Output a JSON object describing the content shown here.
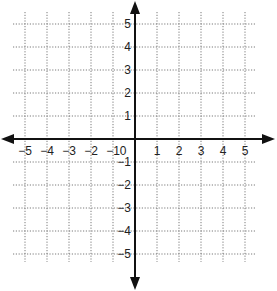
{
  "diagram": {
    "type": "coordinate-plane",
    "x_range": [
      -5,
      5
    ],
    "y_range": [
      -5,
      5
    ],
    "grid": "dotted",
    "origin_label": "0",
    "x_tick_labels": [
      "−5",
      "−4",
      "−3",
      "−2",
      "−1",
      "1",
      "2",
      "3",
      "4",
      "5"
    ],
    "y_tick_labels": [
      "5",
      "4",
      "3",
      "2",
      "1",
      "−1",
      "−2",
      "−3",
      "−4",
      "−5"
    ],
    "colors": {
      "axis": "#111111",
      "grid": "#7a7a7a",
      "background": "#ffffff"
    }
  }
}
